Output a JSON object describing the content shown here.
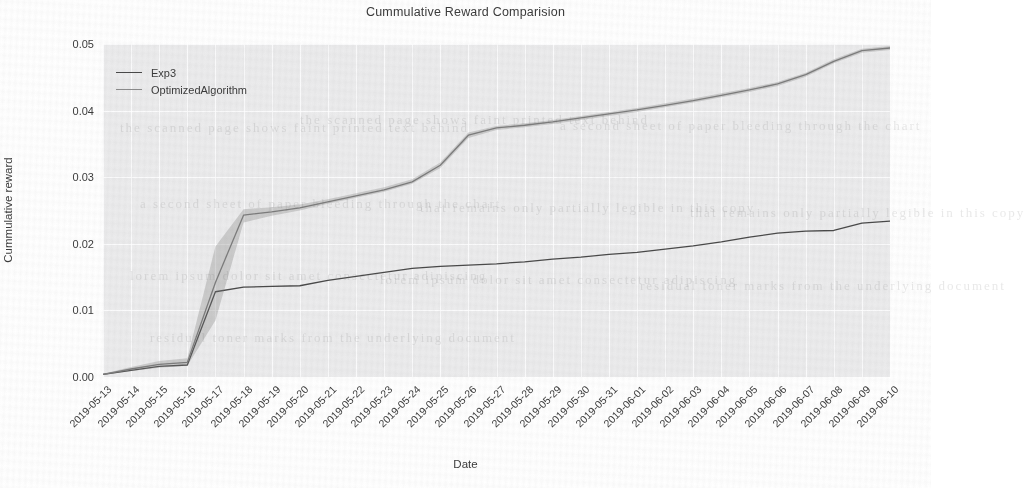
{
  "chart_data": {
    "type": "line",
    "title": "Cummulative Reward Comparision",
    "xlabel": "Date",
    "ylabel": "Cummulative reward",
    "ylim": [
      0.0,
      0.05
    ],
    "yticks": [
      "0.00",
      "0.01",
      "0.02",
      "0.03",
      "0.04",
      "0.05"
    ],
    "ytick_values": [
      0.0,
      0.01,
      0.02,
      0.03,
      0.04,
      0.05
    ],
    "grid": true,
    "legend_position": "upper left",
    "categories": [
      "2019-05-13",
      "2019-05-14",
      "2019-05-15",
      "2019-05-16",
      "2019-05-17",
      "2019-05-18",
      "2019-05-19",
      "2019-05-20",
      "2019-05-21",
      "2019-05-22",
      "2019-05-23",
      "2019-05-24",
      "2019-05-25",
      "2019-05-26",
      "2019-05-27",
      "2019-05-28",
      "2019-05-29",
      "2019-05-30",
      "2019-05-31",
      "2019-06-01",
      "2019-06-02",
      "2019-06-03",
      "2019-06-04",
      "2019-06-05",
      "2019-06-06",
      "2019-06-07",
      "2019-06-08",
      "2019-06-09",
      "2019-06-10"
    ],
    "series": [
      {
        "name": "Exp3",
        "color": "#4a4a4a",
        "values": [
          0.0004,
          0.001,
          0.0016,
          0.0018,
          0.0128,
          0.0135,
          0.0136,
          0.0137,
          0.0145,
          0.0151,
          0.0157,
          0.0163,
          0.0166,
          0.0168,
          0.017,
          0.0173,
          0.0177,
          0.018,
          0.0184,
          0.0187,
          0.0192,
          0.0197,
          0.0203,
          0.021,
          0.0216,
          0.0219,
          0.022,
          0.0231,
          0.0234
        ]
      },
      {
        "name": "OptimizedAlgorithm",
        "color": "#7d7d7d",
        "values": [
          0.0004,
          0.0012,
          0.0019,
          0.0022,
          0.0142,
          0.0243,
          0.0248,
          0.0254,
          0.0263,
          0.0272,
          0.0281,
          0.0293,
          0.0318,
          0.0363,
          0.0374,
          0.0378,
          0.0383,
          0.0389,
          0.0395,
          0.0401,
          0.0408,
          0.0415,
          0.0423,
          0.0431,
          0.044,
          0.0454,
          0.0474,
          0.049,
          0.0494
        ],
        "band_low": [
          0.0003,
          0.0009,
          0.0014,
          0.0017,
          0.0085,
          0.0232,
          0.0242,
          0.025,
          0.026,
          0.0269,
          0.0278,
          0.029,
          0.0314,
          0.0359,
          0.0371,
          0.0375,
          0.038,
          0.0386,
          0.0392,
          0.0398,
          0.0405,
          0.0412,
          0.042,
          0.0428,
          0.0437,
          0.0451,
          0.0471,
          0.0487,
          0.0491
        ],
        "band_high": [
          0.0005,
          0.0015,
          0.0024,
          0.0028,
          0.0196,
          0.0252,
          0.0255,
          0.0259,
          0.0267,
          0.0276,
          0.0285,
          0.0297,
          0.0322,
          0.0367,
          0.0377,
          0.0381,
          0.0386,
          0.0392,
          0.0398,
          0.0404,
          0.0411,
          0.0418,
          0.0426,
          0.0434,
          0.0443,
          0.0457,
          0.0477,
          0.0493,
          0.0497
        ]
      }
    ]
  },
  "legend": {
    "entries": [
      {
        "label": "Exp3",
        "color": "#4a4a4a"
      },
      {
        "label": "OptimizedAlgorithm",
        "color": "#8d8d8d"
      }
    ]
  },
  "style": {
    "plot_background": "#ececed",
    "grid_color": "#ffffff",
    "page_background": "#ffffff",
    "text_color": "#3c3c3c"
  },
  "ghost_watermarks": [
    "the scanned page shows faint printed text behind",
    "a second sheet of paper bleeding through the chart",
    "that remains only partially legible in this copy",
    "lorem ipsum dolor sit amet consectetur adipiscing",
    "residual toner marks from the underlying document"
  ]
}
